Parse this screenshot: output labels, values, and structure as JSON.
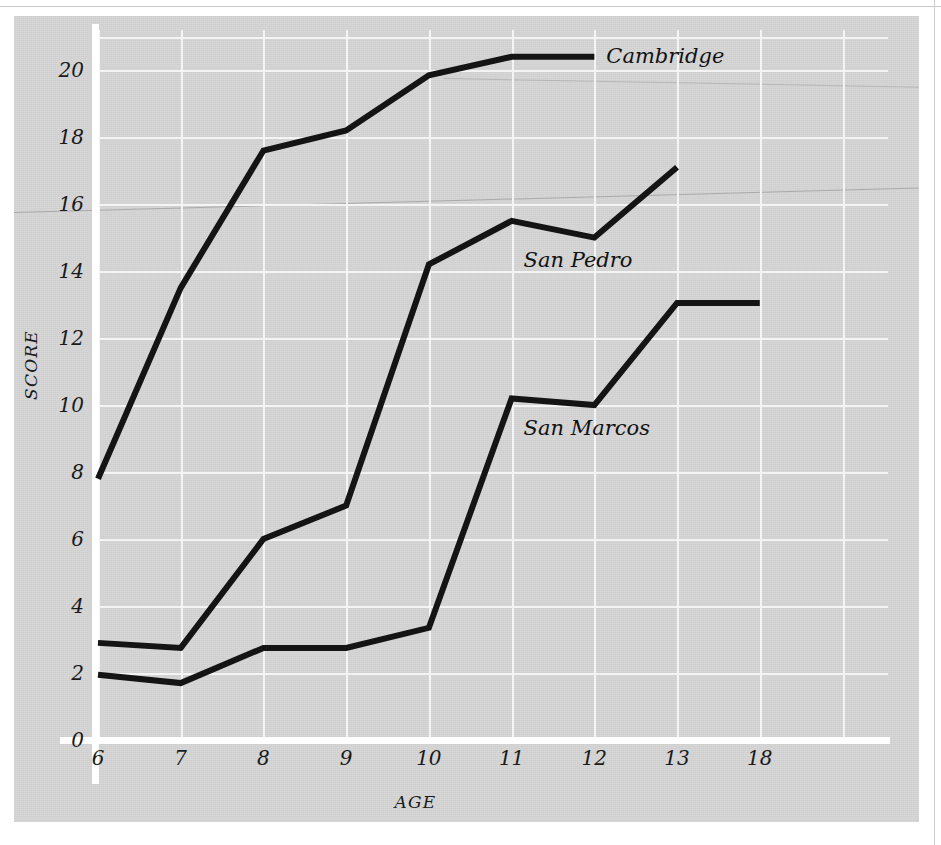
{
  "chart_data": {
    "type": "line",
    "title": "",
    "subtitle": "",
    "xlabel": "AGE",
    "ylabel": "SCORE",
    "x": [
      6,
      7,
      8,
      9,
      10,
      11,
      12,
      13,
      18
    ],
    "xtick_labels": [
      "6",
      "7",
      "8",
      "9",
      "10",
      "11",
      "12",
      "13",
      "18"
    ],
    "ytick_labels": [
      "0",
      "2",
      "4",
      "6",
      "8",
      "10",
      "12",
      "14",
      "16",
      "18",
      "20"
    ],
    "ytick_values": [
      0,
      2,
      4,
      6,
      8,
      10,
      12,
      14,
      16,
      18,
      20
    ],
    "ylim": [
      0,
      21.2
    ],
    "xlim_categories": true,
    "grid": "both",
    "grid_color": "#f4f4f4",
    "panel_color": "#d4d4d4",
    "line_color": "#141414",
    "legend_position": "inline-end-of-line",
    "series": [
      {
        "name": "Cambridge",
        "label": "Cambridge",
        "x": [
          6,
          7,
          8,
          9,
          10,
          11,
          12
        ],
        "values": [
          7.8,
          13.5,
          17.6,
          18.2,
          19.85,
          20.4,
          20.4
        ],
        "label_x": 12,
        "label_y": 20.4
      },
      {
        "name": "San Pedro",
        "label": "San Pedro",
        "x": [
          6,
          7,
          8,
          9,
          10,
          11,
          12,
          13
        ],
        "values": [
          2.9,
          2.75,
          6.0,
          7.0,
          14.2,
          15.5,
          15.0,
          17.1
        ],
        "label_x": 11,
        "label_y": 14.3
      },
      {
        "name": "San Marcos",
        "label": "San Marcos",
        "x": [
          6,
          7,
          8,
          9,
          10,
          11,
          12,
          13,
          18
        ],
        "values": [
          1.95,
          1.7,
          2.75,
          2.75,
          3.35,
          10.2,
          10.0,
          13.05,
          13.05
        ],
        "label_x": 11,
        "label_y": 9.3
      }
    ]
  },
  "axes": {
    "y_title": "SCORE",
    "x_title": "AGE"
  }
}
